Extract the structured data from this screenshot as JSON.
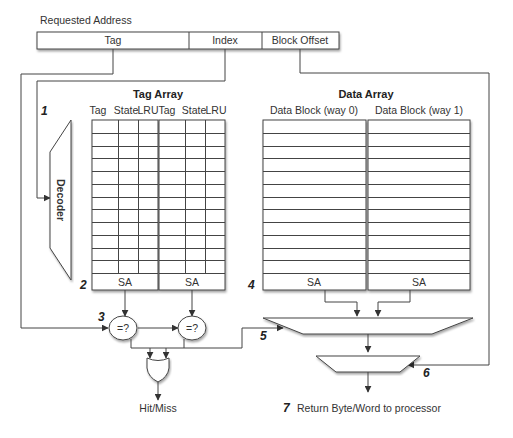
{
  "address": {
    "caption": "Requested Address",
    "fields": [
      {
        "label": "Tag"
      },
      {
        "label": "Index"
      },
      {
        "label": "Block Offset"
      }
    ]
  },
  "tag_array": {
    "title": "Tag Array",
    "ways": [
      {
        "columns": [
          "Tag",
          "State",
          "LRU"
        ],
        "sense_amp": "SA"
      },
      {
        "columns": [
          "Tag",
          "State",
          "LRU"
        ],
        "sense_amp": "SA"
      }
    ],
    "rows": 12
  },
  "data_array": {
    "title": "Data Array",
    "ways": [
      {
        "label": "Data Block (way 0)",
        "sense_amp": "SA"
      },
      {
        "label": "Data Block (way 1)",
        "sense_amp": "SA"
      }
    ],
    "rows": 12
  },
  "decoder": {
    "label": "Decoder"
  },
  "comparators": [
    {
      "label": "=?"
    },
    {
      "label": "=?"
    }
  ],
  "outputs": {
    "hit_miss": "Hit/Miss",
    "return": "Return Byte/Word to processor"
  },
  "steps": [
    "1",
    "2",
    "3",
    "4",
    "5",
    "6",
    "7"
  ]
}
